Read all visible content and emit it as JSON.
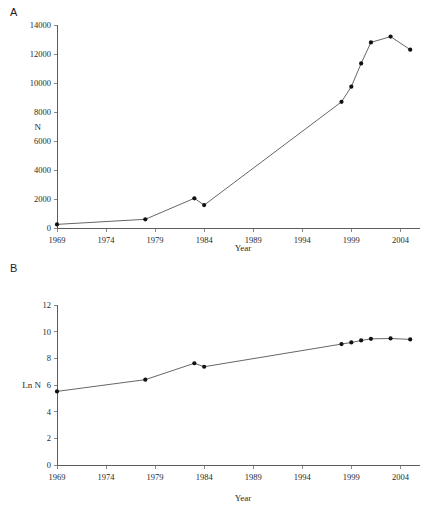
{
  "figure": {
    "panels": [
      {
        "id": "A",
        "label": "A",
        "ylabel": "N",
        "xlabel": "Year"
      },
      {
        "id": "B",
        "label": "B",
        "ylabel": "Ln N",
        "xlabel": "Year"
      }
    ]
  },
  "chart_data": [
    {
      "type": "line",
      "panel": "A",
      "title": "",
      "xlabel": "Year",
      "ylabel": "N",
      "xlim": [
        1969,
        2006
      ],
      "ylim": [
        0,
        14000
      ],
      "xticks": [
        1969,
        1974,
        1979,
        1984,
        1989,
        1994,
        1999,
        2004
      ],
      "yticks": [
        0,
        2000,
        4000,
        6000,
        8000,
        10000,
        12000,
        14000
      ],
      "xtick_labels": [
        "1969",
        "1974",
        "1979",
        "1984",
        "1989",
        "1994",
        "1999",
        "2004"
      ],
      "ytick_labels": [
        "0",
        "2000",
        "4000",
        "6000",
        "8000",
        "10000",
        "12000",
        "14000"
      ],
      "grid": false,
      "legend": null,
      "series": [
        {
          "name": "N",
          "x": [
            1969,
            1978,
            1983,
            1984,
            1998,
            1999,
            2000,
            2001,
            2003,
            2005
          ],
          "values": [
            250,
            600,
            2050,
            1580,
            8700,
            9750,
            11350,
            12800,
            13200,
            12300
          ]
        }
      ]
    },
    {
      "type": "line",
      "panel": "B",
      "title": "",
      "xlabel": "Year",
      "ylabel": "Ln N",
      "xlim": [
        1969,
        2006
      ],
      "ylim": [
        0,
        12
      ],
      "xticks": [
        1969,
        1974,
        1979,
        1984,
        1989,
        1994,
        1999,
        2004
      ],
      "yticks": [
        0,
        2,
        4,
        6,
        8,
        10,
        12
      ],
      "xtick_labels": [
        "1969",
        "1974",
        "1979",
        "1984",
        "1989",
        "1994",
        "1999",
        "2004"
      ],
      "ytick_labels": [
        "0",
        "2",
        "4",
        "6",
        "8",
        "10",
        "12"
      ],
      "grid": false,
      "legend": null,
      "series": [
        {
          "name": "Ln N",
          "x": [
            1969,
            1978,
            1983,
            1984,
            1998,
            1999,
            2000,
            2001,
            2003,
            2005
          ],
          "values": [
            5.52,
            6.4,
            7.63,
            7.37,
            9.07,
            9.19,
            9.34,
            9.46,
            9.49,
            9.42
          ]
        }
      ]
    }
  ]
}
